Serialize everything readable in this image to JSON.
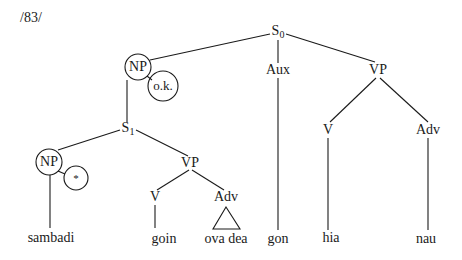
{
  "page_number": "/83/",
  "tree": {
    "root": {
      "label": "S",
      "subscript": "0"
    },
    "np_top": {
      "label": "NP",
      "annotation": "o.k."
    },
    "aux": {
      "label": "Aux"
    },
    "vp_right": {
      "label": "VP"
    },
    "v_right": {
      "label": "V"
    },
    "adv_right": {
      "label": "Adv"
    },
    "s1": {
      "label": "S",
      "subscript": "1"
    },
    "np_lower": {
      "label": "NP",
      "annotation": "*"
    },
    "vp_mid": {
      "label": "VP"
    },
    "v_mid": {
      "label": "V"
    },
    "adv_mid": {
      "label": "Adv"
    },
    "leaves": {
      "sambadi": "sambadi",
      "goin": "goin",
      "ova_dea": "ova dea",
      "gon": "gon",
      "hia": "hia",
      "nau": "nau"
    }
  }
}
